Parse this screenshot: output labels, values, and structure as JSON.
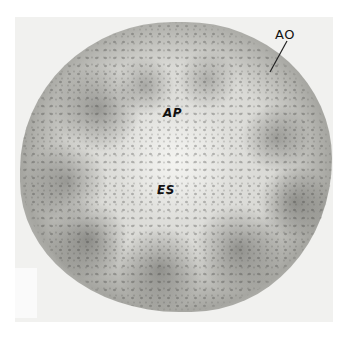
{
  "figure": {
    "type": "electron micrograph",
    "labels": [
      {
        "id": "AO",
        "text": "AO"
      },
      {
        "id": "AP",
        "text": "AP"
      },
      {
        "id": "ES",
        "text": "ES"
      }
    ]
  },
  "colors": {
    "background": "#ffffff",
    "photo": "#f1f1ef",
    "cell_dark": "#a6a6a1",
    "label": "#111111"
  }
}
